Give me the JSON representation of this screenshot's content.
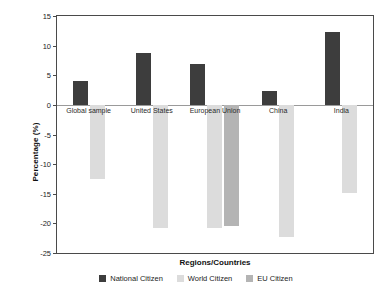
{
  "chart_data": {
    "type": "bar",
    "title": "",
    "xlabel": "Regions/Countries",
    "ylabel": "Percentage (%)",
    "categories": [
      "Global sample",
      "United States",
      "European Union",
      "China",
      "India"
    ],
    "series": [
      {
        "name": "National Citizen",
        "color": "#3d3d3d",
        "values": [
          4.1,
          8.8,
          6.9,
          2.4,
          12.3
        ]
      },
      {
        "name": "World Citizen",
        "color": "#dcdcdc",
        "values": [
          -12.5,
          -20.7,
          -20.7,
          -22.3,
          -14.8
        ]
      },
      {
        "name": "EU Citizen",
        "color": "#b4b4b4",
        "values": [
          null,
          null,
          -20.5,
          null,
          null
        ]
      }
    ],
    "ylim": [
      -25,
      15
    ],
    "yticks": [
      15,
      10,
      5,
      0,
      -5,
      -10,
      -15,
      -20,
      -25
    ],
    "ytick_labels": [
      "15",
      "10",
      "5",
      "0",
      "-5",
      "-10",
      "-15",
      "-20",
      "-25"
    ],
    "grid": false,
    "legend_position": "bottom",
    "zero_line": true,
    "axis_color": "#4a4a4a"
  }
}
